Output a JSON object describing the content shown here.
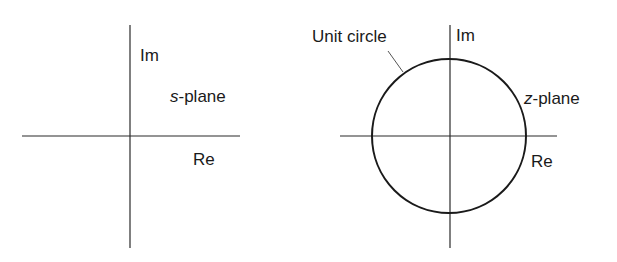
{
  "s_plane": {
    "imag_axis_label": "Im",
    "real_axis_label": "Re",
    "plane_var": "s",
    "plane_suffix": "-plane"
  },
  "z_plane": {
    "imag_axis_label": "Im",
    "real_axis_label": "Re",
    "plane_var": "z",
    "plane_suffix": "-plane",
    "circle_label": "Unit circle"
  },
  "colors": {
    "line": "#1a1a1a",
    "background": "#ffffff"
  }
}
